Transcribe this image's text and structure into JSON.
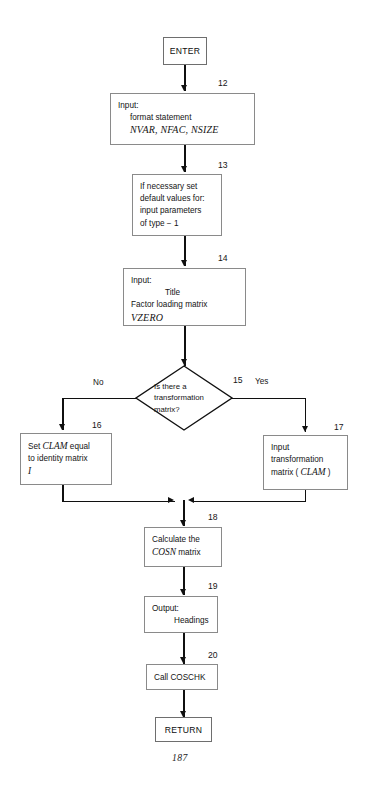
{
  "document": {
    "page_number": "187",
    "type": "flowchart"
  },
  "nodes": {
    "enter": {
      "label": "ENTER"
    },
    "n12": {
      "number": "12",
      "line1": "Input:",
      "line2": "format statement",
      "line3": "NVAR, NFAC, NSIZE"
    },
    "n13": {
      "number": "13",
      "line1": "If necessary set",
      "line2": "default values for:",
      "line3": "input parameters",
      "line4": "of type − 1"
    },
    "n14": {
      "number": "14",
      "line1": "Input:",
      "line2": "Title",
      "line3": "Factor loading matrix",
      "line4": "VZERO"
    },
    "n15": {
      "number": "15",
      "line1": "Is there a",
      "line2": "transformation",
      "line3": "matrix?",
      "branch_no": "No",
      "branch_yes": "Yes"
    },
    "n16": {
      "number": "16",
      "line1a": "Set ",
      "line1b": "CLAM",
      "line1c": " equal",
      "line2": "to identity matrix",
      "line3": "I"
    },
    "n17": {
      "number": "17",
      "line1": "Input",
      "line2": "transformation",
      "line3a": "matrix ( ",
      "line3b": "CLAM",
      "line3c": " )"
    },
    "n18": {
      "number": "18",
      "line1": "Calculate the",
      "line2a": "COSN",
      "line2b": " matrix"
    },
    "n19": {
      "number": "19",
      "line1": "Output:",
      "line2": "Headings"
    },
    "n20": {
      "number": "20",
      "line1": "Call COSCHK"
    },
    "return": {
      "label": "RETURN"
    }
  },
  "colors": {
    "line": "#101010",
    "box_border": "#8a8a8a",
    "background": "#ffffff"
  }
}
